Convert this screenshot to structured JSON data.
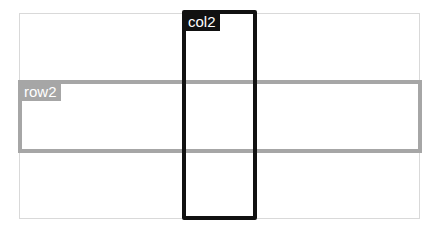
{
  "diagram": {
    "grid": {
      "border_color": "#d9d9d9"
    },
    "row": {
      "label": "row2",
      "color": "#a6a6a6"
    },
    "column": {
      "label": "col2",
      "color": "#111111"
    }
  }
}
